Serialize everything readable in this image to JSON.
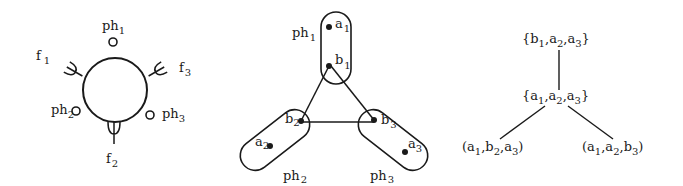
{
  "figure_left": {
    "nodes": [
      {
        "id": "ph1",
        "base": "ph",
        "sub": "1"
      },
      {
        "id": "ph2",
        "base": "ph",
        "sub": "2"
      },
      {
        "id": "ph3",
        "base": "ph",
        "sub": "3"
      },
      {
        "id": "f1",
        "base": "f",
        "sub": "1"
      },
      {
        "id": "f2",
        "base": "f",
        "sub": "2"
      },
      {
        "id": "f3",
        "base": "f",
        "sub": "3"
      }
    ]
  },
  "figure_middle": {
    "groups": [
      {
        "label_base": "ph",
        "label_sub": "1",
        "points": [
          {
            "base": "a",
            "sub": "1"
          },
          {
            "base": "b",
            "sub": "1"
          }
        ]
      },
      {
        "label_base": "ph",
        "label_sub": "2",
        "points": [
          {
            "base": "a",
            "sub": "2"
          },
          {
            "base": "b",
            "sub": "2"
          }
        ]
      },
      {
        "label_base": "ph",
        "label_sub": "3",
        "points": [
          {
            "base": "a",
            "sub": "3"
          },
          {
            "base": "b",
            "sub": "3"
          }
        ]
      }
    ],
    "edges": [
      [
        "b1",
        "b2"
      ],
      [
        "b1",
        "b3"
      ],
      [
        "b2",
        "b3"
      ]
    ]
  },
  "figure_right": {
    "nodes": [
      {
        "id": "top",
        "text": "{b1, a2, a3}",
        "parts": [
          {
            "base": "b",
            "sub": "1"
          },
          {
            "base": "a",
            "sub": "2"
          },
          {
            "base": "a",
            "sub": "3"
          }
        ],
        "open": "{",
        "close": "}"
      },
      {
        "id": "mid",
        "text": "{a1, a2, a3}",
        "parts": [
          {
            "base": "a",
            "sub": "1"
          },
          {
            "base": "a",
            "sub": "2"
          },
          {
            "base": "a",
            "sub": "3"
          }
        ],
        "open": "{",
        "close": "}"
      },
      {
        "id": "left",
        "text": "(a1, b2, a3)",
        "parts": [
          {
            "base": "a",
            "sub": "1"
          },
          {
            "base": "b",
            "sub": "2"
          },
          {
            "base": "a",
            "sub": "3"
          }
        ],
        "open": "(",
        "close": ")"
      },
      {
        "id": "right",
        "text": "(a1, a2, b3)",
        "parts": [
          {
            "base": "a",
            "sub": "1"
          },
          {
            "base": "a",
            "sub": "2"
          },
          {
            "base": "b",
            "sub": "3"
          }
        ],
        "open": "(",
        "close": ")"
      }
    ],
    "edges": [
      [
        "top",
        "mid"
      ],
      [
        "mid",
        "left"
      ],
      [
        "mid",
        "right"
      ]
    ]
  }
}
